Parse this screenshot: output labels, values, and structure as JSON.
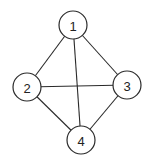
{
  "diagram": {
    "type": "undirected-graph",
    "width": 155,
    "height": 165,
    "node_radius": 14,
    "colors": {
      "stroke": "#2a2a2a",
      "fill": "#ffffff",
      "text": "#222222",
      "background": "#ffffff"
    },
    "nodes": [
      {
        "id": "1",
        "label": "1",
        "x": 73,
        "y": 25
      },
      {
        "id": "2",
        "label": "2",
        "x": 27,
        "y": 87
      },
      {
        "id": "3",
        "label": "3",
        "x": 127,
        "y": 85
      },
      {
        "id": "4",
        "label": "4",
        "x": 81,
        "y": 140
      }
    ],
    "edges": [
      {
        "from": "1",
        "to": "2"
      },
      {
        "from": "1",
        "to": "3"
      },
      {
        "from": "1",
        "to": "4"
      },
      {
        "from": "2",
        "to": "3"
      },
      {
        "from": "2",
        "to": "4"
      },
      {
        "from": "3",
        "to": "4"
      }
    ]
  }
}
